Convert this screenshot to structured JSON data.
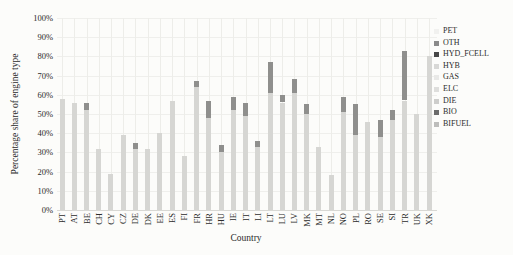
{
  "figure": {
    "ylabel": "Percentage share of engine type",
    "xlabel": "Country"
  },
  "chart_data": {
    "type": "bar",
    "stacked": true,
    "title": "",
    "xlabel": "Country",
    "ylabel": "Percentage share of engine type",
    "ylim": [
      0,
      100
    ],
    "ytick_step": 10,
    "ytick_suffix": "%",
    "grid": true,
    "legend_position": "right",
    "legend": [
      {
        "label": "PET",
        "color": "#f1f1ef"
      },
      {
        "label": "OTH",
        "color": "#8a8a8a"
      },
      {
        "label": "HYD_FCELL",
        "color": "#474747"
      },
      {
        "label": "HYB",
        "color": "#d8d8d6"
      },
      {
        "label": "GAS",
        "color": "#e9e9e7"
      },
      {
        "label": "ELC",
        "color": "#dededc"
      },
      {
        "label": "DIE",
        "color": "#cdcdcb"
      },
      {
        "label": "BIO",
        "color": "#6b6b6b"
      },
      {
        "label": "BIFUEL",
        "color": "#bdbdbb"
      }
    ],
    "categories": [
      "PT",
      "AT",
      "BE",
      "CH",
      "CY",
      "CZ",
      "DE",
      "DK",
      "EE",
      "ES",
      "FI",
      "FR",
      "HR",
      "HU",
      "IE",
      "IT",
      "LI",
      "LT",
      "LU",
      "LV",
      "MK",
      "MT",
      "NL",
      "NO",
      "PL",
      "RO",
      "SE",
      "SI",
      "TR",
      "UK",
      "XK"
    ],
    "series": [
      {
        "name": "PET",
        "color": "#d6d6d3",
        "values": [
          58,
          56,
          52,
          32,
          19,
          39,
          32,
          32,
          40,
          57,
          28,
          64,
          48,
          30,
          52,
          49,
          33,
          61,
          56,
          61,
          50,
          33,
          18,
          51,
          39,
          46,
          38,
          47,
          57,
          50,
          80
        ]
      },
      {
        "name": "DIE",
        "color": "#8f8f8d",
        "values": [
          0,
          0,
          4,
          0,
          0,
          0,
          3,
          0,
          0,
          0,
          0,
          3,
          9,
          4,
          7,
          7,
          3,
          16,
          4,
          7,
          5,
          0,
          0,
          8,
          16,
          0,
          9,
          5,
          26,
          0,
          0
        ]
      }
    ]
  }
}
